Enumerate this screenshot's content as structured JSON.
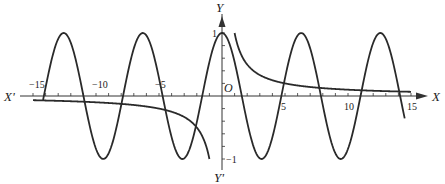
{
  "chart_data": {
    "type": "line",
    "title": "",
    "xlabel": "X",
    "xlabel_negative": "X'",
    "ylabel": "Y",
    "ylabel_negative": "Y'",
    "origin_label": "O",
    "xlim": [
      -15,
      15
    ],
    "ylim": [
      -1,
      1
    ],
    "x_ticks": [
      -15,
      -10,
      -5,
      5,
      10,
      15
    ],
    "x_tick_labels": [
      "−15",
      "−10",
      "−5",
      "5",
      "10",
      "15"
    ],
    "y_ticks": [
      1,
      -1
    ],
    "y_tick_labels": [
      "1",
      "−1"
    ],
    "grid": false,
    "legend": null,
    "series": [
      {
        "name": "y = cos x",
        "function": "cos(x)",
        "domain": [
          -14.2,
          14.5
        ]
      },
      {
        "name": "y = 1/x (x>0)",
        "function": "1/x",
        "domain": [
          1,
          15
        ]
      },
      {
        "name": "y = 1/x (x<0)",
        "function": "1/x",
        "domain": [
          -15,
          -1
        ]
      }
    ]
  },
  "style": {
    "curve_color": "#2a2a2a",
    "axis_color": "#333333",
    "background": "#ffffff"
  }
}
